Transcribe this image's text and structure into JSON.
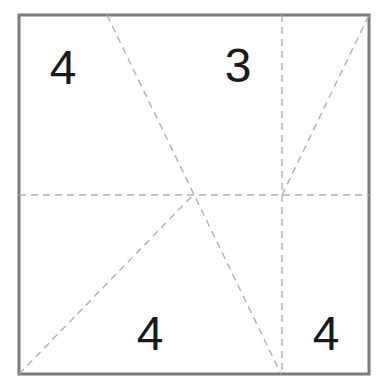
{
  "diagram": {
    "type": "folded-square-regions",
    "colors": {
      "frame": "#7a7a7a",
      "fold_lines": "#b0b0b0",
      "labels": "#1a1a1a",
      "background": "#ffffff"
    },
    "frame": {
      "x1": 19,
      "y1": 15,
      "x2": 369,
      "y2": 374
    },
    "fold_lines": [
      {
        "id": "horizontal-middle",
        "x1": 19,
        "y1": 195,
        "x2": 369,
        "y2": 195
      },
      {
        "id": "vertical-right",
        "x1": 282,
        "y1": 15,
        "x2": 282,
        "y2": 374
      },
      {
        "id": "diagonal-top-to-bottom",
        "x1": 107,
        "y1": 15,
        "x2": 281,
        "y2": 374
      },
      {
        "id": "diagonal-bottom-left",
        "x1": 19,
        "y1": 374,
        "x2": 193,
        "y2": 195
      },
      {
        "id": "diagonal-top-right",
        "x1": 282,
        "y1": 195,
        "x2": 369,
        "y2": 15
      }
    ],
    "labels": [
      {
        "id": "top-left",
        "text": "4",
        "x": 63,
        "y": 84
      },
      {
        "id": "top-middle",
        "text": "3",
        "x": 238,
        "y": 82
      },
      {
        "id": "bottom-middle",
        "text": "4",
        "x": 150,
        "y": 350
      },
      {
        "id": "bottom-right",
        "text": "4",
        "x": 326,
        "y": 350
      }
    ]
  }
}
